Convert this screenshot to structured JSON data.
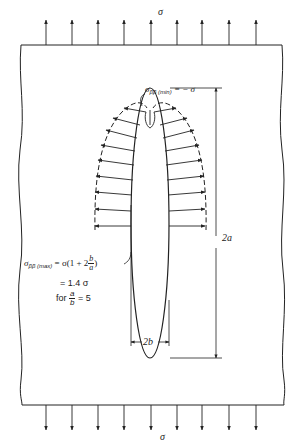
{
  "figure": {
    "applied_stress_top": "σ",
    "applied_stress_bottom": "σ",
    "min_stress_label": {
      "symbol": "σ",
      "subscript": "ββ (min)",
      "value": "= − σ"
    },
    "max_stress_label": {
      "symbol": "σ",
      "subscript": "ββ (max)",
      "expression_prefix": "= σ(1 + 2",
      "fraction_num": "b",
      "fraction_den": "a",
      "expression_suffix": ")",
      "line2": "= 1.4 σ",
      "line3_prefix": "for",
      "line3_frac_num": "a",
      "line3_frac_den": "b",
      "line3_suffix": "= 5"
    },
    "dimension_height": "2a",
    "dimension_width": "2b",
    "top_arrow_count": 9,
    "bottom_arrow_count": 9,
    "colors": {
      "ink": "#222222",
      "background": "#ffffff"
    }
  }
}
